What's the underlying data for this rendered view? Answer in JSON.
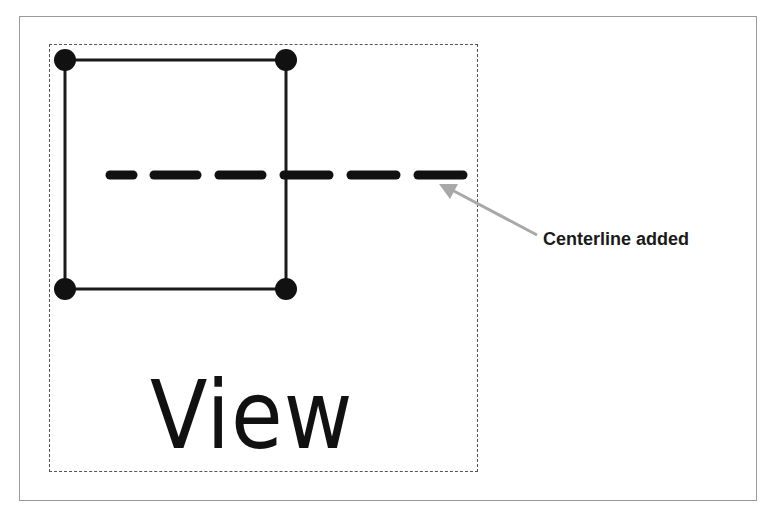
{
  "figure": {
    "view_label": "View",
    "callout_text": "Centerline added",
    "colors": {
      "stroke": "#1a1a1a",
      "arrow": "#a8a8a8",
      "frame": "#9a9a9a",
      "dashed_box": "#555555"
    },
    "square": {
      "corners": [
        [
          65,
          60
        ],
        [
          286,
          60
        ],
        [
          286,
          289
        ],
        [
          65,
          289
        ]
      ]
    },
    "centerline": {
      "y": 175,
      "x_start": 105,
      "x_end": 467,
      "dash_count": 6
    },
    "caption_partial": ""
  }
}
